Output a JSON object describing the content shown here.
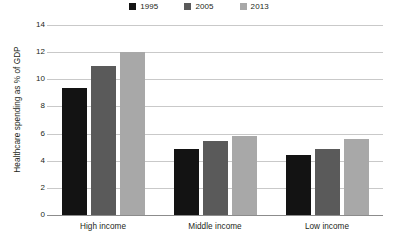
{
  "chart_data": {
    "type": "bar",
    "title": "",
    "xlabel": "",
    "ylabel": "Healthcare spending as % of GDP",
    "categories": [
      "High income",
      "Middle income",
      "Low income"
    ],
    "series": [
      {
        "name": "1995",
        "color": "#131313",
        "values": [
          9.35,
          4.9,
          4.4
        ]
      },
      {
        "name": "2005",
        "color": "#5a5a5a",
        "values": [
          11.0,
          5.45,
          4.9
        ]
      },
      {
        "name": "2013",
        "color": "#a8a8a8",
        "values": [
          12.0,
          5.8,
          5.6
        ]
      }
    ],
    "ylim": [
      0,
      14
    ],
    "ytick_step": 2,
    "yticks": [
      "14",
      "12",
      "10",
      "8",
      "6",
      "4",
      "2",
      "0"
    ],
    "grid": true,
    "legend_position": "top-center"
  },
  "legend": {
    "items": [
      {
        "label": "1995",
        "swatch_color": "#131313",
        "icon": "square-swatch-icon"
      },
      {
        "label": "2005",
        "swatch_color": "#5a5a5a",
        "icon": "square-swatch-icon"
      },
      {
        "label": "2013",
        "swatch_color": "#a8a8a8",
        "icon": "square-swatch-icon"
      }
    ]
  },
  "axes": {
    "y_title": "Healthcare spending as % of GDP",
    "y_tick_labels": [
      "14",
      "12",
      "10",
      "8",
      "6",
      "4",
      "2",
      "0"
    ],
    "x_tick_labels": [
      "High income",
      "Middle income",
      "Low income"
    ]
  },
  "colors": {
    "gridline": "#c9c9c9",
    "axis": "#8c8c8c",
    "text": "#231f20",
    "background": "#ffffff"
  }
}
